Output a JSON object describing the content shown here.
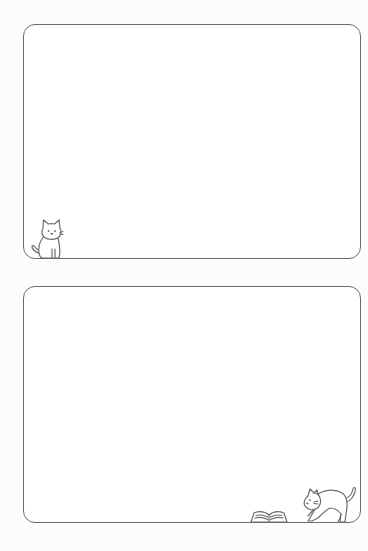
{
  "page": {
    "type": "notepad-stationery-sheet",
    "background_color": "#fcfcfb",
    "frame_border_color": "#6b6b6b"
  },
  "frames": [
    {
      "id": "top",
      "decorations": [
        {
          "icon": "sitting-cat-icon",
          "position": "bottom-left"
        }
      ]
    },
    {
      "id": "bottom",
      "decorations": [
        {
          "icon": "open-book-icon",
          "position": "bottom-right"
        },
        {
          "icon": "stretching-cat-icon",
          "position": "bottom-right"
        }
      ]
    }
  ]
}
